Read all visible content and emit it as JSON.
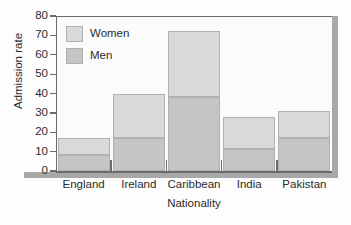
{
  "chart_data": {
    "type": "bar",
    "stacked": true,
    "title": "",
    "xlabel": "Nationality",
    "ylabel": "Admission rate",
    "categories": [
      "England",
      "Ireland",
      "Caribbean",
      "India",
      "Pakistan"
    ],
    "series": [
      {
        "name": "Men",
        "values": [
          8.5,
          17,
          38,
          11.5,
          17
        ]
      },
      {
        "name": "Women",
        "values": [
          8.5,
          22.5,
          34.5,
          16.5,
          14
        ]
      }
    ],
    "totals": [
      17,
      39.5,
      72.5,
      28,
      31
    ],
    "ylim": [
      0,
      80
    ],
    "yticks": [
      0,
      10,
      20,
      30,
      40,
      50,
      60,
      70,
      80
    ],
    "ytick_labels": [
      "0",
      "10",
      "20",
      "30",
      "40",
      "50",
      "60",
      "70",
      "80"
    ],
    "grid": false,
    "legend": {
      "position": "upper-left-inside",
      "entries": [
        {
          "label": "Women",
          "color": "#d9d9d9"
        },
        {
          "label": "Men",
          "color": "#c5c5c5"
        }
      ]
    },
    "colors": {
      "women": "#d9d9d9",
      "men": "#c5c5c5",
      "bar_border": "#b0b0b0",
      "axis": "#6b6b6b",
      "shadow": "#a8a8a8",
      "plot_background": "#fbfbfb",
      "figure_background": "#fdfdfd",
      "text": "#2b2b2b"
    }
  }
}
